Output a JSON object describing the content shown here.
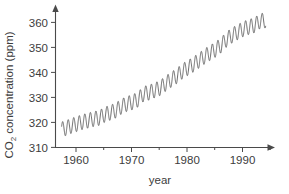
{
  "chart_data": {
    "type": "line",
    "title": "",
    "xlabel": "year",
    "ylabel": "CO",
    "ylabel_sub": "2",
    "ylabel_rest": " concentration (ppm)",
    "ylabel_full": "CO2 concentration (ppm)",
    "xlim": [
      1957.0,
      1996.5
    ],
    "ylim": [
      308.0,
      364.0
    ],
    "xticks": [
      1960,
      1970,
      1980,
      1990
    ],
    "xtick_labels": [
      "1960",
      "1970",
      "1980",
      "1990"
    ],
    "xticks_minor": [
      1965,
      1975,
      1985,
      1995
    ],
    "yticks": [
      310,
      320,
      330,
      340,
      350,
      360
    ],
    "ytick_labels": [
      "310",
      "320",
      "330",
      "340",
      "350",
      "360"
    ],
    "grid": false,
    "legend": null,
    "axis_arrows": true,
    "line_color": "#5a5a5a",
    "axis_color": "#4a4a4a",
    "background_color": "#ffffff",
    "series": [
      {
        "name": "Mauna Loa monthly mean CO2",
        "description": "Keeling curve: rising annual trend with seasonal sawtooth oscillation of about 6 ppm peak-to-peak",
        "x_start": 1958.2,
        "x_end": 1995.0,
        "trend_start_ppm": 315.0,
        "trend_end_ppm": 359.0,
        "seasonal_amplitude_ppm": 3.0,
        "seasonal_peak_month_fraction": 0.38,
        "annual_means": [
          {
            "year": 1958,
            "value": 315.3
          },
          {
            "year": 1959,
            "value": 315.98
          },
          {
            "year": 1960,
            "value": 316.91
          },
          {
            "year": 1961,
            "value": 317.64
          },
          {
            "year": 1962,
            "value": 318.45
          },
          {
            "year": 1963,
            "value": 318.99
          },
          {
            "year": 1964,
            "value": 319.62
          },
          {
            "year": 1965,
            "value": 320.04
          },
          {
            "year": 1966,
            "value": 321.38
          },
          {
            "year": 1967,
            "value": 322.16
          },
          {
            "year": 1968,
            "value": 323.04
          },
          {
            "year": 1969,
            "value": 324.62
          },
          {
            "year": 1970,
            "value": 325.68
          },
          {
            "year": 1971,
            "value": 326.32
          },
          {
            "year": 1972,
            "value": 327.45
          },
          {
            "year": 1973,
            "value": 329.68
          },
          {
            "year": 1974,
            "value": 330.18
          },
          {
            "year": 1975,
            "value": 331.11
          },
          {
            "year": 1976,
            "value": 332.04
          },
          {
            "year": 1977,
            "value": 333.83
          },
          {
            "year": 1978,
            "value": 335.4
          },
          {
            "year": 1979,
            "value": 336.84
          },
          {
            "year": 1980,
            "value": 338.75
          },
          {
            "year": 1981,
            "value": 340.11
          },
          {
            "year": 1982,
            "value": 341.45
          },
          {
            "year": 1983,
            "value": 343.05
          },
          {
            "year": 1984,
            "value": 344.65
          },
          {
            "year": 1985,
            "value": 346.12
          },
          {
            "year": 1986,
            "value": 347.42
          },
          {
            "year": 1987,
            "value": 349.19
          },
          {
            "year": 1988,
            "value": 351.57
          },
          {
            "year": 1989,
            "value": 353.12
          },
          {
            "year": 1990,
            "value": 354.39
          },
          {
            "year": 1991,
            "value": 355.61
          },
          {
            "year": 1992,
            "value": 356.45
          },
          {
            "year": 1993,
            "value": 357.1
          },
          {
            "year": 1994,
            "value": 358.83
          },
          {
            "year": 1995,
            "value": 359.0
          }
        ]
      }
    ]
  },
  "layout": {
    "plot_left_px": 55,
    "plot_right_px": 274,
    "plot_top_px": 8,
    "plot_bottom_px": 148
  }
}
